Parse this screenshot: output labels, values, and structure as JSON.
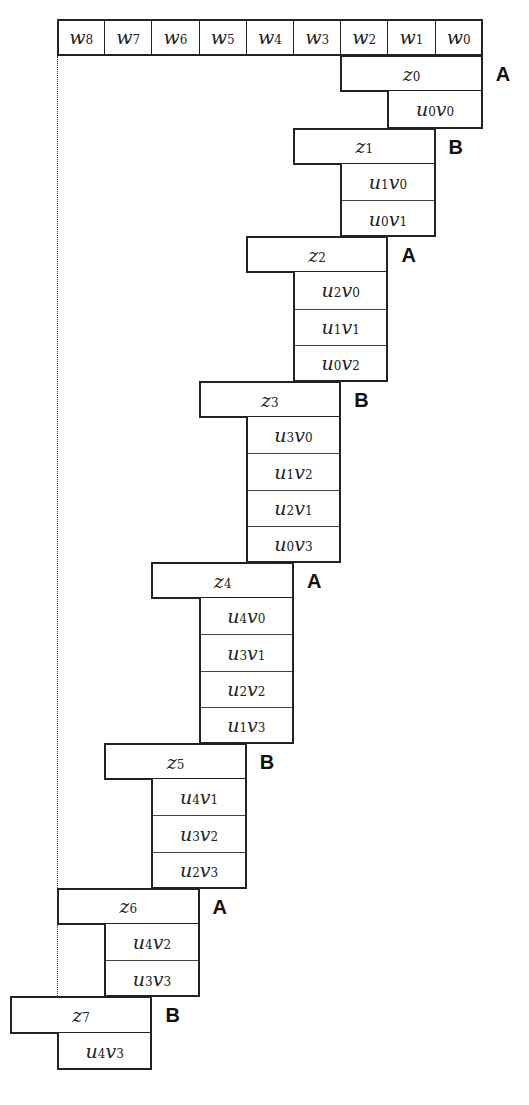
{
  "diagram": {
    "title": "",
    "word_row": [
      "w8",
      "w7",
      "w6",
      "w5",
      "w4",
      "w3",
      "w2",
      "w1",
      "w0"
    ],
    "steps": [
      {
        "z": "z0",
        "tag": "A",
        "products": [
          "u0v0"
        ]
      },
      {
        "z": "z1",
        "tag": "B",
        "products": [
          "u1v0",
          "u0v1"
        ]
      },
      {
        "z": "z2",
        "tag": "A",
        "products": [
          "u2v0",
          "u1v1",
          "u0v2"
        ]
      },
      {
        "z": "z3",
        "tag": "B",
        "products": [
          "u3v0",
          "u1v2",
          "u2v1",
          "u0v3"
        ]
      },
      {
        "z": "z4",
        "tag": "A",
        "products": [
          "u4v0",
          "u3v1",
          "u2v2",
          "u1v3"
        ]
      },
      {
        "z": "z5",
        "tag": "B",
        "products": [
          "u4v1",
          "u3v2",
          "u2v3"
        ]
      },
      {
        "z": "z6",
        "tag": "A",
        "products": [
          "u4v2",
          "u3v3"
        ]
      },
      {
        "z": "z7",
        "tag": "B",
        "products": [
          "u4v3"
        ]
      }
    ],
    "colors": {
      "line": "#222222",
      "background": "#ffffff",
      "text": "#222222"
    }
  }
}
